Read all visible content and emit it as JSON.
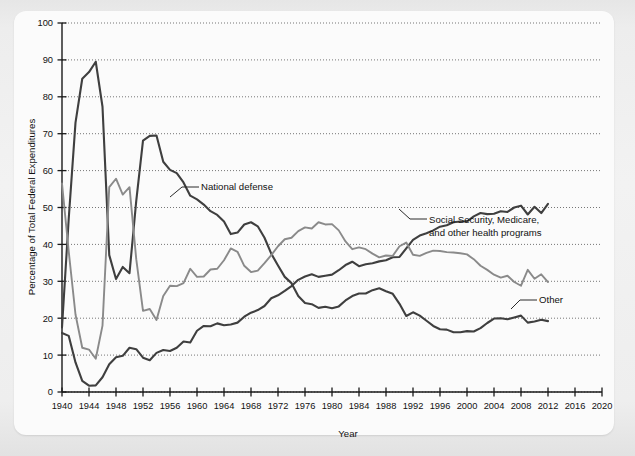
{
  "chart_data": {
    "type": "line",
    "title": "",
    "xlabel": "Year",
    "ylabel": "Percentage of Total Federal Expenditures",
    "xlim": [
      1940,
      2020
    ],
    "ylim": [
      0,
      100
    ],
    "grid": true,
    "legend_position": "inline-annotations",
    "x_ticks": [
      1940,
      1944,
      1948,
      1952,
      1956,
      1960,
      1964,
      1968,
      1972,
      1976,
      1980,
      1984,
      1988,
      1992,
      1996,
      2000,
      2004,
      2008,
      2012,
      2016,
      2020
    ],
    "y_ticks": [
      0,
      10,
      20,
      30,
      40,
      50,
      60,
      70,
      80,
      90,
      100
    ],
    "colors": {
      "national_defense": "#3f3f3f",
      "social_security": "#3f3f3f",
      "other": "#8a8a8a",
      "gridline": "#555555",
      "axis": "#1a1a1a"
    },
    "series": [
      {
        "name": "National defense",
        "color": "#3f3f3f",
        "label_x": 1967,
        "label_y": 55,
        "x": [
          1940,
          1941,
          1942,
          1943,
          1944,
          1945,
          1946,
          1947,
          1948,
          1949,
          1950,
          1951,
          1952,
          1953,
          1954,
          1955,
          1956,
          1957,
          1958,
          1959,
          1960,
          1961,
          1962,
          1963,
          1964,
          1965,
          1966,
          1967,
          1968,
          1969,
          1970,
          1971,
          1972,
          1973,
          1974,
          1975,
          1976,
          1977,
          1978,
          1979,
          1980,
          1981,
          1982,
          1983,
          1984,
          1985,
          1986,
          1987,
          1988,
          1989,
          1990,
          1991,
          1992,
          1993,
          1994,
          1995,
          1996,
          1997,
          1998,
          1999,
          2000,
          2001,
          2002,
          2003,
          2004,
          2005,
          2006,
          2007,
          2008,
          2009,
          2010,
          2011,
          2012
        ],
        "y": [
          17.5,
          47.1,
          73.0,
          84.9,
          86.7,
          89.5,
          77.3,
          37.1,
          30.6,
          33.9,
          32.2,
          51.8,
          68.1,
          69.4,
          69.5,
          62.4,
          60.2,
          59.3,
          56.8,
          53.2,
          52.2,
          50.8,
          49.0,
          48.0,
          46.2,
          42.8,
          43.2,
          45.4,
          46.0,
          44.9,
          41.8,
          37.5,
          34.3,
          31.2,
          29.5,
          26.0,
          24.1,
          23.8,
          22.8,
          23.1,
          22.7,
          23.2,
          24.8,
          26.0,
          26.7,
          26.7,
          27.6,
          28.1,
          27.3,
          26.6,
          23.9,
          20.6,
          21.6,
          20.7,
          19.3,
          17.9,
          17.0,
          16.9,
          16.2,
          16.2,
          16.5,
          16.4,
          17.3,
          18.7,
          19.9,
          20.0,
          19.7,
          20.2,
          20.7,
          18.8,
          19.1,
          19.6,
          19.2
        ]
      },
      {
        "name": "Social Security, Medicare, and other health programs",
        "color": "#3f3f3f",
        "label_x": 1988,
        "label_y": 42,
        "x": [
          1940,
          1941,
          1942,
          1943,
          1944,
          1945,
          1946,
          1947,
          1948,
          1949,
          1950,
          1951,
          1952,
          1953,
          1954,
          1955,
          1956,
          1957,
          1958,
          1959,
          1960,
          1961,
          1962,
          1963,
          1964,
          1965,
          1966,
          1967,
          1968,
          1969,
          1970,
          1971,
          1972,
          1973,
          1974,
          1975,
          1976,
          1977,
          1978,
          1979,
          1980,
          1981,
          1982,
          1983,
          1984,
          1985,
          1986,
          1987,
          1988,
          1989,
          1990,
          1991,
          1992,
          1993,
          1994,
          1995,
          1996,
          1997,
          1998,
          1999,
          2000,
          2001,
          2002,
          2003,
          2004,
          2005,
          2006,
          2007,
          2008,
          2009,
          2010,
          2011,
          2012
        ],
        "y": [
          16.0,
          15.2,
          8.0,
          3.0,
          1.7,
          1.8,
          4.0,
          7.5,
          9.4,
          9.8,
          12.0,
          11.6,
          9.3,
          8.6,
          10.6,
          11.4,
          11.1,
          12.0,
          13.7,
          13.4,
          16.6,
          17.9,
          17.8,
          18.6,
          18.1,
          18.3,
          18.8,
          20.4,
          21.5,
          22.2,
          23.3,
          25.4,
          26.2,
          27.4,
          28.7,
          30.4,
          31.3,
          31.9,
          31.2,
          31.5,
          31.8,
          33.0,
          34.4,
          35.3,
          34.1,
          34.6,
          34.9,
          35.4,
          35.7,
          36.5,
          36.6,
          38.9,
          41.2,
          42.4,
          43.0,
          43.8,
          44.8,
          45.2,
          46.0,
          46.2,
          46.2,
          47.6,
          48.5,
          48.2,
          48.3,
          49.0,
          48.8,
          50.0,
          50.5,
          48.1,
          50.2,
          48.5,
          51.0
        ]
      },
      {
        "name": "Other",
        "color": "#8a8a8a",
        "label_x": 2013,
        "label_y": 25,
        "x": [
          1940,
          1941,
          1942,
          1943,
          1944,
          1945,
          1946,
          1947,
          1948,
          1949,
          1950,
          1951,
          1952,
          1953,
          1954,
          1955,
          1956,
          1957,
          1958,
          1959,
          1960,
          1961,
          1962,
          1963,
          1964,
          1965,
          1966,
          1967,
          1968,
          1969,
          1970,
          1971,
          1972,
          1973,
          1974,
          1975,
          1976,
          1977,
          1978,
          1979,
          1980,
          1981,
          1982,
          1983,
          1984,
          1985,
          1986,
          1987,
          1988,
          1989,
          1990,
          1991,
          1992,
          1993,
          1994,
          1995,
          1996,
          1997,
          1998,
          1999,
          2000,
          2001,
          2002,
          2003,
          2004,
          2005,
          2006,
          2007,
          2008,
          2009,
          2010,
          2011,
          2012
        ],
        "y": [
          56.5,
          38.0,
          21.0,
          12.0,
          11.5,
          9.0,
          18.0,
          55.5,
          57.8,
          53.5,
          55.5,
          36.0,
          22.0,
          22.5,
          19.5,
          26.0,
          28.8,
          28.7,
          29.5,
          33.4,
          31.2,
          31.3,
          33.2,
          33.4,
          35.7,
          38.9,
          38.0,
          34.2,
          32.5,
          32.9,
          34.9,
          37.1,
          39.5,
          41.4,
          41.8,
          43.6,
          44.6,
          44.3,
          46.0,
          45.4,
          45.5,
          43.8,
          40.8,
          38.7,
          39.2,
          38.7,
          37.5,
          36.5,
          37.0,
          36.9,
          39.5,
          40.5,
          37.2,
          36.9,
          37.7,
          38.3,
          38.2,
          37.9,
          37.8,
          37.6,
          37.3,
          36.0,
          34.2,
          33.1,
          31.8,
          31.0,
          31.5,
          29.8,
          28.8,
          33.1,
          30.7,
          31.9,
          29.8
        ]
      }
    ]
  },
  "annotations": {
    "national_defense": "National defense",
    "social_security_line1": "Social Security, Medicare,",
    "social_security_line2": "and other health programs",
    "other": "Other"
  },
  "axes": {
    "x_title": "Year",
    "y_title": "Percentage of Total Federal Expenditures"
  }
}
